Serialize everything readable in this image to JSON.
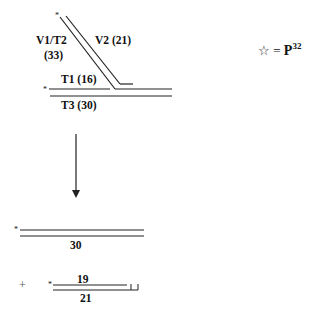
{
  "top_diagram": {
    "labels": {
      "v1t2": "V1/T2",
      "v1t2_len": "(33)",
      "v2": "V2 (21)",
      "t1": "T1 (16)",
      "t3": "T3 (30)"
    }
  },
  "legend": {
    "symbol": "☆",
    "equals": "=",
    "letter": "P",
    "superscript": "32"
  },
  "star_marker": "*",
  "middle_product": {
    "length_label": "30"
  },
  "bottom_product": {
    "plus": "+",
    "top_strand_label": "19",
    "bottom_strand_label": "21"
  }
}
